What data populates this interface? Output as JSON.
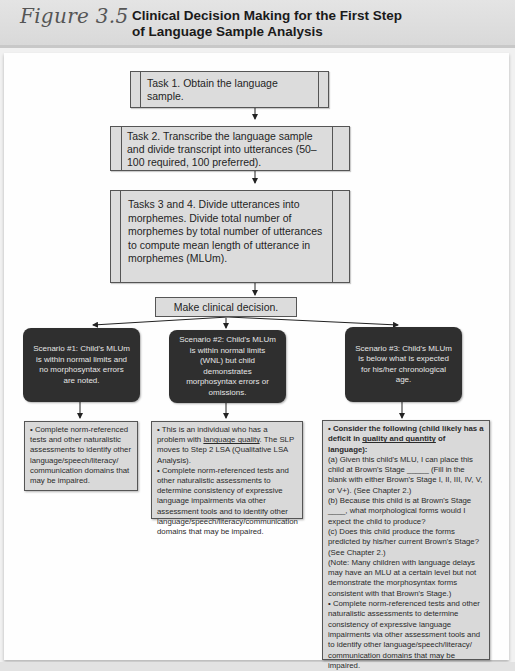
{
  "header": {
    "figure_number": "Figure 3.5",
    "title_line1": "Clinical Decision Making for the First Step",
    "title_line2": "of Language Sample Analysis"
  },
  "tasks": [
    {
      "id": "task1",
      "text": "Task 1. Obtain the language sample."
    },
    {
      "id": "task2",
      "text": "Task 2. Transcribe the language sample and divide transcript into utterances (50–100 required, 100 preferred)."
    },
    {
      "id": "task34",
      "text": "Tasks 3 and 4. Divide utterances into morphemes. Divide total number of morphemes by total number of utterances to compute mean length of utterance in morphemes (MLUm)."
    }
  ],
  "decision": {
    "text": "Make clinical decision."
  },
  "scenarios": [
    {
      "id": "scenario1",
      "text": "Scenario #1: Child's MLUm is within normal limits and no morphosyntax errors are noted."
    },
    {
      "id": "scenario2",
      "text": "Scenario #2: Child's MLUm is within normal limits (WNL) but child demonstrates morphosyntax errors or omissions."
    },
    {
      "id": "scenario3",
      "text": "Scenario #3: Child's MLUm is below what is expected for his/her chronological age."
    }
  ],
  "outcomes": {
    "scenario1": {
      "bullet1": "• Complete norm-referenced tests and other naturalistic assessments to identify other language/speech/literacy/ communication domains that may be impaired."
    },
    "scenario2": {
      "bullet1_pre": "• This is an individual who has a problem with ",
      "bullet1_link": "language quality",
      "bullet1_post": ". The SLP moves to Step 2 LSA (Qualitative LSA Analysis).",
      "bullet2": "• Complete norm-referenced tests and other naturalistic assessments to determine consistency of expressive language impairments via other assessment tools and to identify other language/speech/literacy/communication domains that may be impaired."
    },
    "scenario3": {
      "bullet1_pre": "• Consider the following (child likely has a deficit in ",
      "bullet1_emph": "quality and quantity",
      "bullet1_post": " of language):",
      "item_a": "(a) Given this child's MLU, I can place this child at Brown's Stage _____ (Fill in the blank with either Brown's Stage I, II, III, IV, V, or V+). (See Chapter 2.)",
      "item_b": "(b) Because this child is at Brown's Stage ____, what morphological forms would I expect the child to produce?",
      "item_c": "(c) Does this child produce the forms predicted by his/her current Brown's Stage? (See Chapter 2.)",
      "note": "(Note: Many children with language delays may have an MLU at a certain level but not demonstrate the morphosyntax forms consistent with that Brown's Stage.)",
      "bullet2": "• Complete norm-referenced tests and other naturalistic assessments to determine consistency of expressive language impairments via other assessment tools and to identify other language/speech/literacy/ communication domains that may be impaired."
    }
  }
}
